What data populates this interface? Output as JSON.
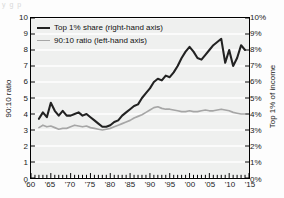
{
  "caption_strip": "y    g          p",
  "chart_data": {
    "type": "line",
    "title": "",
    "xlabel": "",
    "ylabel": "90:10 ratio",
    "ylabel_right": "Top 1% of income",
    "grid": true,
    "legend_position": "top-left",
    "xlim": [
      1960,
      2015
    ],
    "ylim": [
      0,
      10
    ],
    "ylim_right": [
      0,
      10
    ],
    "y_ticks": [
      "0",
      "1",
      "2",
      "3",
      "4",
      "5",
      "6",
      "7",
      "8",
      "9",
      "10"
    ],
    "y_ticks_right": [
      "0%",
      "1%",
      "2%",
      "3%",
      "4%",
      "5%",
      "6%",
      "7%",
      "8%",
      "9%",
      "10%"
    ],
    "x_ticks": [
      "'60",
      "'65",
      "'70",
      "'75",
      "'80",
      "'85",
      "'90",
      "'95",
      "'00",
      "'05",
      "'10",
      "'15"
    ],
    "x_tick_values": [
      1960,
      1965,
      1970,
      1975,
      1980,
      1985,
      1990,
      1995,
      2000,
      2005,
      2010,
      2015
    ],
    "minor_x_tick_interval": 1,
    "colors": {
      "top1_share": "#222222",
      "ratio_9010": "#a6a6a6"
    },
    "series": [
      {
        "name": "Top 1% share (right-hand axis)",
        "axis": "right",
        "unit": "%",
        "color": "#222222",
        "x": [
          1962,
          1963,
          1964,
          1965,
          1966,
          1967,
          1968,
          1969,
          1970,
          1971,
          1972,
          1973,
          1974,
          1975,
          1976,
          1977,
          1978,
          1979,
          1980,
          1981,
          1982,
          1983,
          1984,
          1985,
          1986,
          1987,
          1988,
          1989,
          1990,
          1991,
          1992,
          1993,
          1994,
          1995,
          1996,
          1997,
          1998,
          1999,
          2000,
          2001,
          2002,
          2003,
          2004,
          2005,
          2006,
          2007,
          2008,
          2009,
          2010,
          2011,
          2012,
          2013,
          2014
        ],
        "values": [
          3.7,
          4.1,
          3.8,
          4.7,
          4.2,
          3.9,
          4.2,
          3.9,
          3.9,
          4.0,
          4.1,
          3.9,
          4.0,
          3.8,
          3.6,
          3.4,
          3.2,
          3.2,
          3.3,
          3.5,
          3.6,
          3.9,
          4.1,
          4.3,
          4.5,
          4.6,
          5.0,
          5.3,
          5.6,
          6.0,
          6.2,
          6.1,
          6.4,
          6.3,
          6.6,
          7.0,
          7.5,
          7.9,
          8.2,
          7.9,
          7.5,
          7.4,
          7.7,
          8.0,
          8.3,
          8.5,
          8.7,
          7.2,
          8.0,
          7.0,
          7.5,
          8.3,
          8.0
        ]
      },
      {
        "name": "90:10 ratio (left-hand axis)",
        "axis": "left",
        "unit": "",
        "color": "#a6a6a6",
        "x": [
          1962,
          1963,
          1964,
          1965,
          1966,
          1967,
          1968,
          1969,
          1970,
          1971,
          1972,
          1973,
          1974,
          1975,
          1976,
          1977,
          1978,
          1979,
          1980,
          1981,
          1982,
          1983,
          1984,
          1985,
          1986,
          1987,
          1988,
          1989,
          1990,
          1991,
          1992,
          1993,
          1994,
          1995,
          1996,
          1997,
          1998,
          1999,
          2000,
          2001,
          2002,
          2003,
          2004,
          2005,
          2006,
          2007,
          2008,
          2009,
          2010,
          2011,
          2012,
          2013,
          2014
        ],
        "values": [
          3.15,
          3.3,
          3.2,
          3.25,
          3.15,
          3.05,
          3.1,
          3.1,
          3.2,
          3.3,
          3.25,
          3.2,
          3.25,
          3.15,
          3.1,
          3.05,
          3.0,
          3.05,
          3.1,
          3.2,
          3.3,
          3.4,
          3.5,
          3.6,
          3.75,
          3.85,
          3.95,
          4.1,
          4.25,
          4.4,
          4.45,
          4.35,
          4.3,
          4.3,
          4.25,
          4.2,
          4.15,
          4.15,
          4.2,
          4.15,
          4.15,
          4.2,
          4.25,
          4.2,
          4.2,
          4.25,
          4.3,
          4.25,
          4.2,
          4.1,
          4.05,
          4.0,
          4.0
        ]
      }
    ]
  },
  "legend": {
    "items": [
      {
        "label": "Top 1% share (right-hand axis)",
        "color": "#222222"
      },
      {
        "label": "90:10 ratio (left-hand axis)",
        "color": "#a6a6a6"
      }
    ]
  }
}
